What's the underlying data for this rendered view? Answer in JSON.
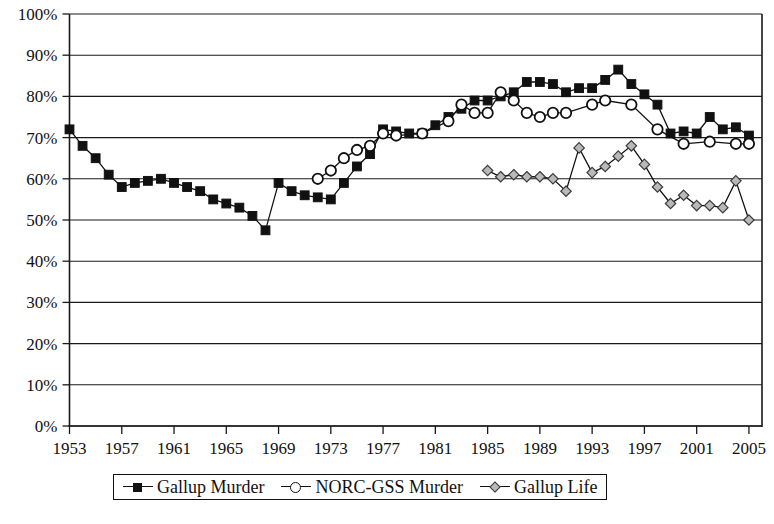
{
  "chart_data": {
    "type": "line",
    "title": "",
    "xlabel": "",
    "ylabel": "",
    "ylim": [
      0,
      100
    ],
    "xlim": [
      1953,
      2006
    ],
    "grid": true,
    "legend_position": "bottom",
    "y_tick_labels": [
      "100%",
      "90%",
      "80%",
      "70%",
      "60%",
      "50%",
      "40%",
      "30%",
      "20%",
      "10%",
      "0%"
    ],
    "y_tick_values": [
      100,
      90,
      80,
      70,
      60,
      50,
      40,
      30,
      20,
      10,
      0
    ],
    "x_tick_labels": [
      "1953",
      "1957",
      "1961",
      "1965",
      "1969",
      "1973",
      "1977",
      "1981",
      "1985",
      "1989",
      "1993",
      "1997",
      "2001",
      "2005"
    ],
    "x_tick_values": [
      1953,
      1957,
      1961,
      1965,
      1969,
      1973,
      1977,
      1981,
      1985,
      1989,
      1993,
      1997,
      2001,
      2005
    ],
    "series": [
      {
        "name": "Gallup Murder",
        "marker": "filled-square",
        "x": [
          1953,
          1954,
          1955,
          1956,
          1957,
          1958,
          1959,
          1960,
          1961,
          1962,
          1963,
          1964,
          1965,
          1966,
          1967,
          1968,
          1969,
          1970,
          1971,
          1972,
          1973,
          1974,
          1975,
          1976,
          1977,
          1978,
          1979,
          1980,
          1981,
          1982,
          1983,
          1984,
          1985,
          1986,
          1987,
          1988,
          1989,
          1990,
          1991,
          1992,
          1993,
          1994,
          1995,
          1996,
          1997,
          1998,
          1999,
          2000,
          2001,
          2002,
          2003,
          2004,
          2005
        ],
        "values": [
          72,
          68,
          65,
          61,
          58,
          59,
          59.5,
          60,
          59,
          58,
          57,
          55,
          54,
          53,
          51,
          47.5,
          59,
          57,
          56,
          55.5,
          55,
          59,
          63,
          66,
          72,
          71.5,
          71,
          71,
          73,
          75,
          77,
          79,
          79,
          80,
          81,
          83.5,
          83.5,
          83,
          81,
          82,
          82,
          84,
          86.5,
          83,
          80.5,
          78,
          71,
          71.5,
          71,
          75,
          72,
          72.5,
          70.5
        ]
      },
      {
        "name": "NORC-GSS Murder",
        "marker": "open-circle",
        "x": [
          1972,
          1973,
          1974,
          1975,
          1976,
          1977,
          1978,
          1980,
          1982,
          1983,
          1984,
          1985,
          1986,
          1987,
          1988,
          1989,
          1990,
          1991,
          1993,
          1994,
          1996,
          1998,
          2000,
          2002,
          2004,
          2005
        ],
        "values": [
          60,
          62,
          65,
          67,
          68,
          71,
          70.5,
          71,
          74,
          78,
          76,
          76,
          81,
          79,
          76,
          75,
          76,
          76,
          78,
          79,
          78,
          72,
          68.5,
          69,
          68.5,
          68.5
        ]
      },
      {
        "name": "Gallup Life",
        "marker": "open-diamond",
        "x": [
          1985,
          1986,
          1987,
          1988,
          1989,
          1990,
          1991,
          1992,
          1993,
          1994,
          1995,
          1996,
          1997,
          1998,
          1999,
          2000,
          2001,
          2002,
          2003,
          2004,
          2005
        ],
        "values": [
          62,
          60.5,
          61,
          60.5,
          60.5,
          60,
          57,
          67.5,
          61.5,
          63,
          65.5,
          68,
          63.5,
          58,
          54,
          56,
          53.5,
          53.5,
          53,
          59.5,
          50
        ]
      }
    ]
  },
  "legend": {
    "items": [
      {
        "label": "Gallup Murder",
        "marker": "filled-square"
      },
      {
        "label": "NORC-GSS Murder",
        "marker": "open-circle"
      },
      {
        "label": "Gallup Life",
        "marker": "open-diamond"
      }
    ]
  }
}
